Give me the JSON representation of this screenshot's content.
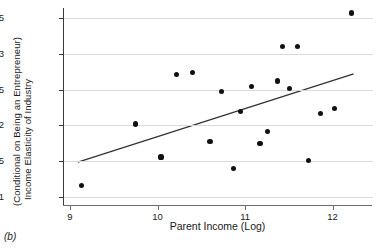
{
  "figure": {
    "panel_caption": "(b)",
    "background_color": "#ffffff",
    "point_color": "#111111",
    "grid_color": "#d9d9d9",
    "axis_color": "#3a3a3a"
  },
  "chart_data": {
    "type": "scatter",
    "title": "",
    "xlabel": "Parent Income (Log)",
    "ylabel": "Income Elasticity of Industry (Conditional on Being an Entrepreneur)",
    "ylabel_line1": "Income Elasticity of Industry",
    "ylabel_line2": "(Conditional on Being an Entrepreneur)",
    "xlim": [
      8.92,
      12.45
    ],
    "ylim": [
      1.089,
      1.364
    ],
    "xticks": [
      9,
      10,
      11,
      12
    ],
    "xticklabels": [
      "9",
      "10",
      "11",
      "12"
    ],
    "yticks": [
      1.1,
      1.15,
      1.2,
      1.25,
      1.3,
      1.35
    ],
    "yticklabels": [
      "1.1",
      "1.15",
      "1.2",
      "1.25",
      "1.3",
      "1.35"
    ],
    "grid": "horizontal",
    "legend": "none",
    "points": [
      {
        "x": 9.13,
        "y": 1.116
      },
      {
        "x": 9.75,
        "y": 1.202
      },
      {
        "x": 10.04,
        "y": 1.156
      },
      {
        "x": 10.22,
        "y": 1.271
      },
      {
        "x": 10.4,
        "y": 1.274
      },
      {
        "x": 10.6,
        "y": 1.178
      },
      {
        "x": 10.73,
        "y": 1.248
      },
      {
        "x": 10.87,
        "y": 1.14
      },
      {
        "x": 10.95,
        "y": 1.219
      },
      {
        "x": 11.07,
        "y": 1.254
      },
      {
        "x": 11.17,
        "y": 1.175
      },
      {
        "x": 11.26,
        "y": 1.192
      },
      {
        "x": 11.37,
        "y": 1.262
      },
      {
        "x": 11.43,
        "y": 1.31
      },
      {
        "x": 11.51,
        "y": 1.252
      },
      {
        "x": 11.6,
        "y": 1.31
      },
      {
        "x": 11.72,
        "y": 1.151
      },
      {
        "x": 11.86,
        "y": 1.217
      },
      {
        "x": 12.02,
        "y": 1.224
      },
      {
        "x": 12.22,
        "y": 1.357
      }
    ],
    "fit_line": {
      "type": "linear",
      "x_start": 9.09,
      "y_start": 1.149,
      "x_end": 12.24,
      "y_end": 1.272,
      "slope": 0.039,
      "color": "#333333"
    }
  }
}
